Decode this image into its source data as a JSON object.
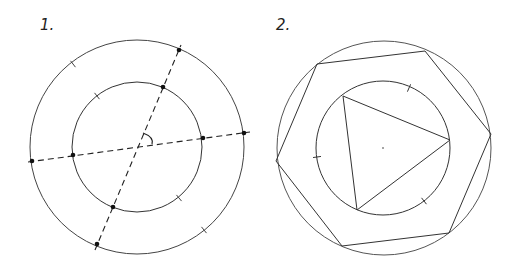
{
  "figures": [
    {
      "label": "1.",
      "description": "Two concentric circles with two dashed diameters crossing at the center and an angle arc marking",
      "center": [
        137,
        147
      ],
      "outer_radius": 107,
      "inner_radius": 65,
      "diameter_lines": [
        {
          "from": [
            32,
            161
          ],
          "to": [
            248,
            132
          ]
        },
        {
          "from": [
            97,
            246
          ],
          "to": [
            179,
            48
          ]
        }
      ],
      "intersection_points": [
        [
          179,
          50
        ],
        [
          244,
          133
        ],
        [
          32,
          161
        ],
        [
          97,
          244
        ],
        [
          163,
          87
        ],
        [
          203,
          138
        ],
        [
          73,
          155
        ],
        [
          113,
          207
        ]
      ],
      "tick_marks": [
        [
          73,
          64
        ],
        [
          204,
          230
        ],
        [
          97,
          96
        ],
        [
          179,
          198
        ]
      ]
    },
    {
      "label": "2.",
      "description": "Circle with inscribed hexagon, inner circle with inscribed triangle",
      "center": [
        383,
        148
      ],
      "outer_radius": 107,
      "inner_radius": 67,
      "hexagon": [
        [
          317,
          64
        ],
        [
          425,
          51
        ],
        [
          491,
          134
        ],
        [
          449,
          233
        ],
        [
          342,
          246
        ],
        [
          276,
          161
        ]
      ],
      "triangle": [
        [
          343,
          96
        ],
        [
          450,
          140
        ],
        [
          357,
          210
        ]
      ],
      "tick_marks": [
        [
          409,
          88
        ],
        [
          317,
          157
        ],
        [
          424,
          201
        ]
      ]
    }
  ],
  "colors": {
    "stroke": "#333333",
    "background": "#ffffff"
  }
}
